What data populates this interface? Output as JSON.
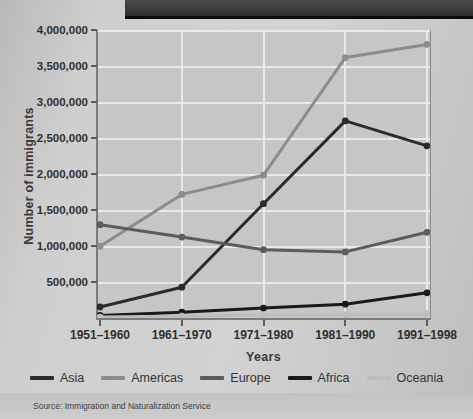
{
  "figure": {
    "source_note": "Source:  Immigration and Naturalization Service"
  },
  "chart_data": {
    "type": "line",
    "title": "",
    "xlabel": "Years",
    "ylabel": "Number of immigrants",
    "categories": [
      "1951–1960",
      "1961–1970",
      "1971–1980",
      "1981–1990",
      "1991–1998"
    ],
    "ylim": [
      0,
      4000000
    ],
    "ytick_labels": [
      "4,000,000",
      "3,500,000",
      "3,000,000",
      "2,500,000",
      "2,000,000",
      "1,500,000",
      "1,000,000",
      "500,000"
    ],
    "ytick_values": [
      4000000,
      3500000,
      3000000,
      2500000,
      2000000,
      1500000,
      1000000,
      500000
    ],
    "grid": true,
    "legend_position": "bottom",
    "series": [
      {
        "name": "Asia",
        "color": "#2b2b2b",
        "values": [
          153000,
          428000,
          1588000,
          2738000,
          2390000
        ]
      },
      {
        "name": "Americas",
        "color": "#8c8c8c",
        "values": [
          997000,
          1717000,
          1983000,
          3616000,
          3800000
        ]
      },
      {
        "name": "Europe",
        "color": "#5c5c5c",
        "values": [
          1296000,
          1123000,
          948000,
          918000,
          1190000
        ]
      },
      {
        "name": "Africa",
        "color": "#1a1a1a",
        "values": [
          35000,
          80000,
          137000,
          192000,
          350000
        ]
      },
      {
        "name": "Oceania",
        "color": "#bdbdbd",
        "values": [
          12000,
          25000,
          40000,
          45000,
          55000
        ]
      }
    ]
  }
}
